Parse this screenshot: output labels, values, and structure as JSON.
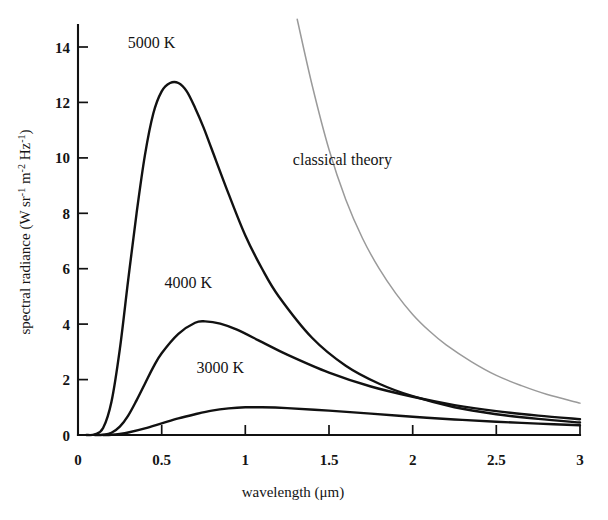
{
  "figure": {
    "background_color": "#ffffff",
    "curve_color": "#111111",
    "classical_color": "#9a9a9a"
  },
  "chart_data": {
    "type": "line",
    "title": "",
    "subtitle": "",
    "xlabel": "wavelength (μm)",
    "xlabel_parts": {
      "text": "wavelength (",
      "unit": "μm",
      "close": ")"
    },
    "ylabel": "spectral radiance (W sr⁻¹ m⁻² Hz⁻¹)",
    "ylabel_parts": {
      "lead": "spectral radiance (W sr",
      "sup1": "-1",
      "mid1": " m",
      "sup2": "-2",
      "mid2": " Hz",
      "sup3": "-1",
      "close": ")"
    },
    "xlim": [
      0,
      3
    ],
    "ylim": [
      0,
      15
    ],
    "grid": false,
    "legend": "inline annotations",
    "xticks": [
      0,
      0.5,
      1,
      1.5,
      2,
      2.5,
      3
    ],
    "xtick_labels": [
      "0",
      "0.5",
      "1",
      "1.5",
      "2",
      "2.5",
      "3"
    ],
    "yticks": [
      0,
      2,
      4,
      6,
      8,
      10,
      12,
      14
    ],
    "ytick_labels": [
      "0",
      "2",
      "4",
      "6",
      "8",
      "10",
      "12",
      "14"
    ],
    "annotations": [
      {
        "name": "curve-label-5000k",
        "text": "5000 K",
        "x": 0.44,
        "y": 13.95
      },
      {
        "name": "curve-label-4000k",
        "text": "4000 K",
        "x": 0.66,
        "y": 5.3
      },
      {
        "name": "curve-label-3000k",
        "text": "3000 K",
        "x": 0.85,
        "y": 2.25
      },
      {
        "name": "curve-label-classical",
        "text": "classical theory",
        "x": 1.58,
        "y": 9.75
      }
    ],
    "series": [
      {
        "name": "5000 K",
        "label": "5000 K",
        "color": "#111111",
        "peak": {
          "wavelength_um": 0.6,
          "radiance": 12.7
        },
        "x": [
          0.05,
          0.1,
          0.15,
          0.2,
          0.25,
          0.3,
          0.35,
          0.4,
          0.45,
          0.5,
          0.55,
          0.6,
          0.65,
          0.7,
          0.75,
          0.8,
          0.9,
          1.0,
          1.1,
          1.2,
          1.4,
          1.6,
          1.8,
          2.0,
          2.25,
          2.5,
          2.75,
          3.0
        ],
        "values": [
          0.0,
          0.02,
          0.25,
          1.2,
          3.1,
          5.6,
          8.0,
          10.1,
          11.6,
          12.4,
          12.7,
          12.7,
          12.4,
          11.8,
          11.1,
          10.3,
          8.7,
          7.2,
          6.0,
          5.0,
          3.5,
          2.5,
          1.85,
          1.4,
          1.0,
          0.75,
          0.58,
          0.45
        ]
      },
      {
        "name": "4000 K",
        "label": "4000 K",
        "color": "#111111",
        "peak": {
          "wavelength_um": 0.76,
          "radiance": 4.1
        },
        "x": [
          0.1,
          0.15,
          0.2,
          0.25,
          0.3,
          0.35,
          0.4,
          0.45,
          0.5,
          0.6,
          0.7,
          0.76,
          0.85,
          0.95,
          1.1,
          1.25,
          1.5,
          1.75,
          2.0,
          2.25,
          2.5,
          2.75,
          3.0
        ],
        "values": [
          0.0,
          0.01,
          0.08,
          0.3,
          0.7,
          1.25,
          1.85,
          2.45,
          2.95,
          3.65,
          4.05,
          4.1,
          4.02,
          3.8,
          3.35,
          2.9,
          2.25,
          1.75,
          1.38,
          1.08,
          0.86,
          0.7,
          0.57
        ]
      },
      {
        "name": "3000 K",
        "label": "3000 K",
        "color": "#111111",
        "peak": {
          "wavelength_um": 1.0,
          "radiance": 1.0
        },
        "x": [
          0.15,
          0.2,
          0.25,
          0.3,
          0.4,
          0.5,
          0.6,
          0.7,
          0.8,
          0.9,
          1.0,
          1.1,
          1.25,
          1.5,
          1.75,
          2.0,
          2.25,
          2.5,
          2.75,
          3.0
        ],
        "values": [
          0.0,
          0.01,
          0.04,
          0.09,
          0.24,
          0.42,
          0.6,
          0.75,
          0.88,
          0.96,
          1.0,
          1.0,
          0.97,
          0.88,
          0.77,
          0.66,
          0.56,
          0.48,
          0.41,
          0.35
        ]
      },
      {
        "name": "classical theory",
        "label": "classical theory",
        "color": "#9a9a9a",
        "note": "Rayleigh-Jeans law, diverges at short wavelength",
        "x": [
          1.31,
          1.4,
          1.5,
          1.6,
          1.7,
          1.8,
          1.9,
          2.0,
          2.1,
          2.2,
          2.35,
          2.5,
          2.65,
          2.8,
          3.0
        ],
        "values": [
          15.0,
          12.6,
          10.3,
          8.5,
          7.1,
          6.0,
          5.1,
          4.35,
          3.75,
          3.25,
          2.65,
          2.15,
          1.78,
          1.47,
          1.15
        ]
      }
    ]
  }
}
